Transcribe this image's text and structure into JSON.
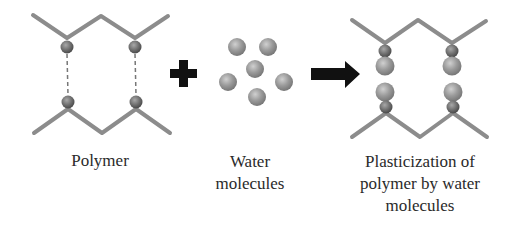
{
  "diagram": {
    "panels": [
      {
        "id": "polymer",
        "label_lines": [
          "Polymer"
        ]
      },
      {
        "id": "water",
        "label_lines": [
          "Water",
          "molecules"
        ]
      },
      {
        "id": "plasticized",
        "label_lines": [
          "Plasticization of",
          "polymer by water",
          "molecules"
        ]
      }
    ],
    "operators": {
      "plus": "plus-sign",
      "arrow": "right-arrow"
    },
    "colors": {
      "chain": "#8c8c8c",
      "node": "#6e6e6e",
      "water": "#9a9a9a",
      "operator": "#111111",
      "text": "#2a2a2a"
    }
  }
}
